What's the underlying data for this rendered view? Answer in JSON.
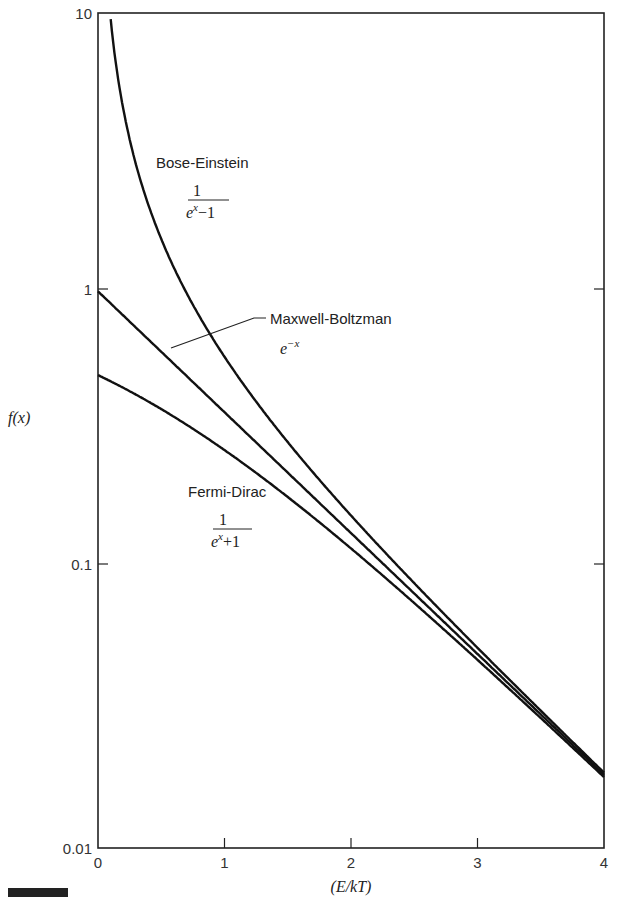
{
  "chart_data": {
    "type": "line",
    "title": "",
    "xlabel": "(E/kT)",
    "ylabel": "f(x)",
    "xlim": [
      0,
      4
    ],
    "ylim": [
      0.01,
      10
    ],
    "yscale": "log",
    "grid": false,
    "legend": "inline labels",
    "x_ticks": [
      "0",
      "1",
      "2",
      "3",
      "4"
    ],
    "y_ticks": [
      "0.01",
      "0.1",
      "1",
      "10"
    ],
    "x": [
      0.0,
      0.1,
      0.2,
      0.3,
      0.5,
      0.75,
      1.0,
      1.5,
      2.0,
      2.5,
      3.0,
      3.5,
      4.0
    ],
    "series": [
      {
        "name": "Bose-Einstein",
        "formula": "1/(e^x - 1)",
        "values": [
          null,
          9.51,
          4.52,
          2.86,
          1.54,
          0.895,
          0.582,
          0.287,
          0.157,
          0.089,
          0.052,
          0.031,
          0.0187
        ]
      },
      {
        "name": "Maxwell-Boltzman",
        "formula": "e^-x",
        "values": [
          1.0,
          0.905,
          0.819,
          0.741,
          0.607,
          0.472,
          0.368,
          0.223,
          0.135,
          0.082,
          0.0498,
          0.0302,
          0.0183
        ]
      },
      {
        "name": "Fermi-Dirac",
        "formula": "1/(e^x + 1)",
        "values": [
          0.5,
          0.475,
          0.45,
          0.426,
          0.378,
          0.321,
          0.269,
          0.182,
          0.119,
          0.076,
          0.0474,
          0.0293,
          0.018
        ]
      }
    ],
    "annotations": [
      {
        "label": "Bose-Einstein",
        "formula_num": "1",
        "formula_den_base": "e",
        "formula_den_exp": "x",
        "formula_den_rest": "−1"
      },
      {
        "label": "Maxwell-Boltzman",
        "formula_base": "e",
        "formula_exp": "−x"
      },
      {
        "label": "Fermi-Dirac",
        "formula_num": "1",
        "formula_den_base": "e",
        "formula_den_exp": "x",
        "formula_den_rest": "+1"
      }
    ]
  }
}
